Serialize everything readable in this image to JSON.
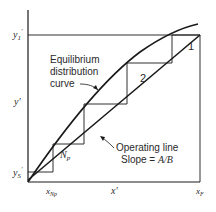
{
  "figure": {
    "type": "McCabe-Thiele staircase diagram (countercurrent extraction)",
    "axes": {
      "x_axis_label": "x′",
      "y_axis_label": "y′",
      "x_ticks": {
        "left": "x′Np",
        "right": "x′F"
      },
      "y_ticks": {
        "bottom": "y′S",
        "top": "y′1"
      }
    },
    "annotations": {
      "equilibrium_line1": "Equilibrium",
      "equilibrium_line2": "distribution",
      "equilibrium_line3": "curve",
      "operating_line1": "Operating line",
      "operating_line2": "Slope = A/B"
    },
    "stages": [
      {
        "label": "1"
      },
      {
        "label": "2"
      },
      {
        "label": "Np"
      }
    ],
    "colors": {
      "line": "#1a1a1a",
      "background": "#ffffff"
    }
  }
}
